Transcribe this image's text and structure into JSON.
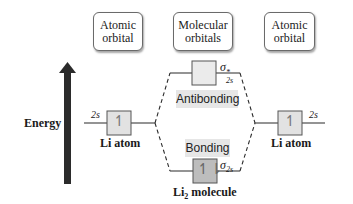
{
  "headers": {
    "left": "Atomic orbital",
    "left_l1": "Atomic",
    "left_l2": "orbital",
    "middle_l1": "Molecular",
    "middle_l2": "orbitals",
    "right_l1": "Atomic",
    "right_l2": "orbital"
  },
  "axis": {
    "label": "Energy",
    "direction": "up"
  },
  "left_atom": {
    "orbital": "2s",
    "label": "Li atom",
    "electrons": "↿"
  },
  "right_atom": {
    "orbital": "2s",
    "label": "Li atom",
    "electrons": "↿"
  },
  "antibonding": {
    "symbol": "σ",
    "subscript": "2s",
    "superscript": "*",
    "label": "Antibonding",
    "electrons": ""
  },
  "bonding": {
    "symbol": "σ",
    "subscript": "2s",
    "label": "Bonding",
    "electrons": "↿⇂"
  },
  "molecule": {
    "label_main": "Li",
    "label_sub": "2",
    "label_rest": " molecule"
  },
  "colors": {
    "box_fill": "#e2e2e2",
    "bond_box_fill": "#bdbdbd",
    "arrow": "#2b2b2b",
    "line": "#2b2b2b"
  }
}
